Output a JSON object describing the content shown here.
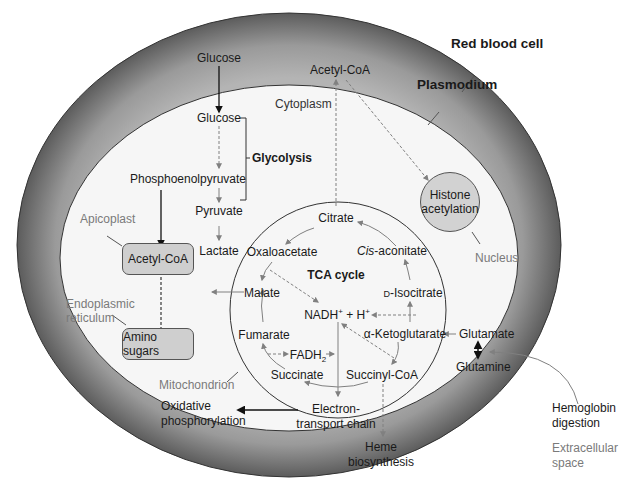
{
  "compartments": {
    "red_blood_cell": "Red blood cell",
    "plasmodium": "Plasmodium",
    "cytoplasm": "Cytoplasm",
    "apicoplast": "Apicoplast",
    "endoplasmic_reticulum": [
      "Endoplasmic",
      "reticulum"
    ],
    "mitochondrion": "Mitochondrion",
    "nucleus": "Nucleus",
    "extracellular_space": [
      "Extracellular",
      "space"
    ]
  },
  "glycolysis": {
    "label": "Glycolysis",
    "glucose_outside": "Glucose",
    "glucose_inside": "Glucose",
    "pep": "Phosphoenolpyruvate",
    "pyruvate": "Pyruvate",
    "lactate": "Lactate"
  },
  "apicoplast_box": "Acetyl-CoA",
  "er_box": "Amino sugars",
  "cyto_acetyl_coa": "Acetyl-CoA",
  "nucleus_box": [
    "Histone",
    "acetylation"
  ],
  "tca": {
    "title": "TCA cycle",
    "citrate": "Citrate",
    "cis_aconitate_italic": "Cis",
    "cis_aconitate_rest": "-aconitate",
    "isocitrate": "D-Isocitrate",
    "isocitrate_prefix": "D",
    "isocitrate_rest": "-Isocitrate",
    "ketoglutarate": "α-Ketoglutarate",
    "succinyl_coa": "Succinyl-CoA",
    "succinate": "Succinate",
    "fadh2_main": "FADH",
    "fadh2_sub": "2",
    "fumarate": "Fumarate",
    "malate": "Malate",
    "oxaloacetate": "Oxaloacetate",
    "nadh_main": "NADH",
    "nadh_sup": "+",
    "nadh_plus": " + H",
    "h_sup": "+"
  },
  "etc": [
    "Electron-",
    "transport chain"
  ],
  "oxphos": [
    "Oxidative",
    "phosphorylation"
  ],
  "heme": [
    "Heme",
    "biosynthesis"
  ],
  "glutamate": "Glutamate",
  "glutamine": "Glutamine",
  "hemoglobin": [
    "Hemoglobin",
    "digestion"
  ],
  "colors": {
    "rbc_dark": "#5a5a5a",
    "rbc_light": "#a8a8a8",
    "cytoplasm_fill": "#f6f6f6",
    "organelle_fill": "#cfcfcf",
    "arrow_solid": "#111111",
    "arrow_gray": "#808080",
    "compartment_label": "#7a7a7a"
  }
}
